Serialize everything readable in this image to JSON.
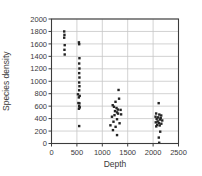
{
  "figure": {
    "background": "#ffffff"
  },
  "chart_data": {
    "type": "scatter",
    "title": "",
    "xlabel": "Depth",
    "ylabel": "Species density",
    "xlim": [
      0,
      2500
    ],
    "ylim": [
      0,
      2000
    ],
    "xticks": [
      0,
      500,
      1000,
      1500,
      2000,
      2500
    ],
    "yticks": [
      0,
      200,
      400,
      600,
      800,
      1000,
      1200,
      1400,
      1600,
      1800,
      2000
    ],
    "grid": true,
    "legend": "none",
    "colors": {
      "grid": "#c6c6c6",
      "frame": "#3c3c3c",
      "text": "#3a3a3a",
      "marker": "#242424"
    },
    "points": [
      [
        250,
        1800
      ],
      [
        255,
        1745
      ],
      [
        250,
        1700
      ],
      [
        260,
        1580
      ],
      [
        255,
        1505
      ],
      [
        260,
        1430
      ],
      [
        540,
        1625
      ],
      [
        545,
        1595
      ],
      [
        550,
        1370
      ],
      [
        545,
        1285
      ],
      [
        550,
        1205
      ],
      [
        545,
        1130
      ],
      [
        550,
        1060
      ],
      [
        545,
        980
      ],
      [
        550,
        920
      ],
      [
        545,
        855
      ],
      [
        520,
        790
      ],
      [
        555,
        765
      ],
      [
        538,
        740
      ],
      [
        530,
        650
      ],
      [
        550,
        645
      ],
      [
        545,
        600
      ],
      [
        556,
        580
      ],
      [
        540,
        558
      ],
      [
        545,
        280
      ],
      [
        1320,
        860
      ],
      [
        1330,
        720
      ],
      [
        1260,
        670
      ],
      [
        1205,
        615
      ],
      [
        1230,
        590
      ],
      [
        1280,
        570
      ],
      [
        1305,
        545
      ],
      [
        1360,
        540
      ],
      [
        1250,
        520
      ],
      [
        1290,
        500
      ],
      [
        1310,
        480
      ],
      [
        1370,
        468
      ],
      [
        1240,
        455
      ],
      [
        1190,
        430
      ],
      [
        1290,
        390
      ],
      [
        1220,
        350
      ],
      [
        1340,
        325
      ],
      [
        1160,
        292
      ],
      [
        1262,
        268
      ],
      [
        1210,
        215
      ],
      [
        1290,
        135
      ],
      [
        2110,
        648
      ],
      [
        2060,
        482
      ],
      [
        2122,
        465
      ],
      [
        2160,
        450
      ],
      [
        2048,
        430
      ],
      [
        2100,
        420
      ],
      [
        2150,
        408
      ],
      [
        2070,
        395
      ],
      [
        2132,
        385
      ],
      [
        2180,
        370
      ],
      [
        2090,
        355
      ],
      [
        2052,
        340
      ],
      [
        2112,
        330
      ],
      [
        2162,
        318
      ],
      [
        2080,
        300
      ],
      [
        2130,
        290
      ],
      [
        2062,
        275
      ],
      [
        2140,
        190
      ],
      [
        2112,
        95
      ],
      [
        2120,
        12
      ]
    ],
    "plot_box": {
      "left": 51.5,
      "top": 19,
      "width": 127,
      "height": 124.5
    },
    "marker_size": 2.4,
    "tick_font_size": 7.5,
    "axis_font_size": 8.5
  }
}
